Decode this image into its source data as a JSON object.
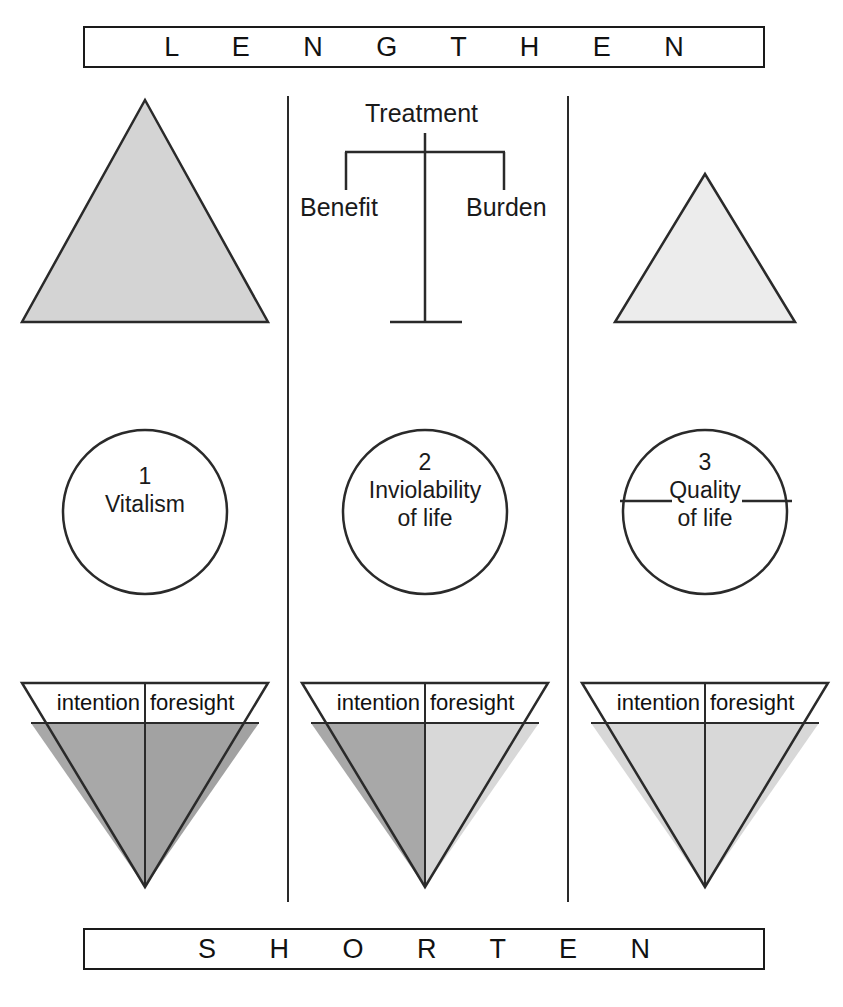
{
  "banners": {
    "top": "L E N G T H E N",
    "bottom": "S H O R T E N"
  },
  "scale": {
    "title": "Treatment",
    "left_pan": "Benefit",
    "right_pan": "Burden"
  },
  "columns": [
    {
      "index": "1",
      "circle": {
        "number": "1",
        "line1": "Vitalism",
        "line2": ""
      },
      "triangle_up": {
        "size": "large",
        "fill": "#d4d4d4",
        "present": true
      },
      "triangle_down": {
        "left_label": "intention",
        "right_label": "foresight",
        "left_fill": "#a8a8a8",
        "right_fill": "#a2a2a2"
      },
      "crossed_out": false
    },
    {
      "index": "2",
      "circle": {
        "number": "2",
        "line1": "Inviolability",
        "line2": "of life"
      },
      "triangle_up": {
        "size": "none",
        "fill": "none",
        "present": false
      },
      "triangle_down": {
        "left_label": "intention",
        "right_label": "foresight",
        "left_fill": "#a8a8a8",
        "right_fill": "#d8d8d8"
      },
      "crossed_out": false
    },
    {
      "index": "3",
      "circle": {
        "number": "3",
        "line1": "Quality",
        "line2": "of life"
      },
      "triangle_up": {
        "size": "small",
        "fill": "#ececec",
        "present": true
      },
      "triangle_down": {
        "left_label": "intention",
        "right_label": "foresight",
        "left_fill": "#d8d8d8",
        "right_fill": "#d8d8d8"
      },
      "crossed_out": true
    }
  ],
  "colors": {
    "stroke": "#2a2a2a",
    "text": "#1a1a1a",
    "background": "#ffffff",
    "fill_dark": "#a8a8a8",
    "fill_medium": "#d4d4d4",
    "fill_light": "#ececec"
  }
}
